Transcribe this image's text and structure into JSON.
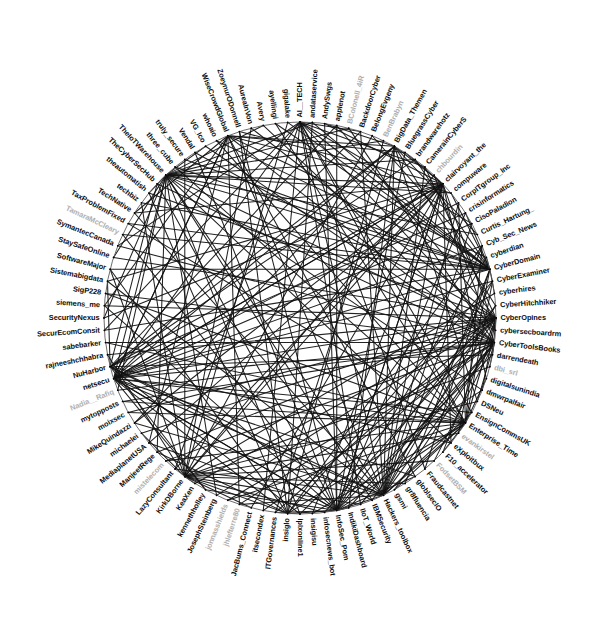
{
  "figure": {
    "title": "",
    "type": "circular-network-graph",
    "background_color": "#ffffff",
    "label_color": "#0d0d0d",
    "dim_label_color": "#aeaeae",
    "edge_color": "#111111",
    "ring_color": "#5a5a5a"
  },
  "chart_data": {
    "type": "scatter",
    "layout": "circular",
    "title": "",
    "subtitle": "",
    "xlabel": "",
    "ylabel": "",
    "grid": false,
    "legend": null,
    "center_x": 300,
    "center_y": 318,
    "radius": 196,
    "node_count": 100,
    "edge_count": 204,
    "nodes": [
      {
        "id": 0,
        "label": "AI__TECH",
        "dim": false
      },
      {
        "id": 1,
        "label": "andataservice",
        "dim": false
      },
      {
        "id": 2,
        "label": "AndySwgs",
        "dim": false
      },
      {
        "id": 3,
        "label": "applenot",
        "dim": false
      },
      {
        "id": 4,
        "label": "BColonell_4iR",
        "dim": true
      },
      {
        "id": 5,
        "label": "BackdoorCyber",
        "dim": false
      },
      {
        "id": 6,
        "label": "BelongEvgeny",
        "dim": false
      },
      {
        "id": 7,
        "label": "BenBrabyn",
        "dim": true
      },
      {
        "id": 8,
        "label": "BigData_Themen",
        "dim": false
      },
      {
        "id": 9,
        "label": "BluegrassCyber",
        "dim": false
      },
      {
        "id": 10,
        "label": "brandwarehotz",
        "dim": false
      },
      {
        "id": 11,
        "label": "CamerainCyberS",
        "dim": false
      },
      {
        "id": 12,
        "label": "chbourdin",
        "dim": true
      },
      {
        "id": 13,
        "label": "clairvoyant_the",
        "dim": false
      },
      {
        "id": 14,
        "label": "compuware",
        "dim": false
      },
      {
        "id": 15,
        "label": "CorpITgroup_Inc",
        "dim": false
      },
      {
        "id": 16,
        "label": "crisinformatics",
        "dim": false
      },
      {
        "id": 17,
        "label": "CisoPaladion",
        "dim": false
      },
      {
        "id": 18,
        "label": "Curtis_Hartung_",
        "dim": false
      },
      {
        "id": 19,
        "label": "Cyb_Sec_News",
        "dim": false
      },
      {
        "id": 20,
        "label": "cyberdian",
        "dim": false
      },
      {
        "id": 21,
        "label": "CyberDomain",
        "dim": false
      },
      {
        "id": 22,
        "label": "CyberExaminer",
        "dim": false
      },
      {
        "id": 23,
        "label": "cyberhires",
        "dim": false
      },
      {
        "id": 24,
        "label": "CyberHitchhiker",
        "dim": false
      },
      {
        "id": 25,
        "label": "CyberOpines",
        "dim": false
      },
      {
        "id": 26,
        "label": "cybersecboardrm",
        "dim": false
      },
      {
        "id": 27,
        "label": "CyberToolsBooks",
        "dim": false
      },
      {
        "id": 28,
        "label": "darrendeath",
        "dim": false
      },
      {
        "id": 29,
        "label": "dbi_srl",
        "dim": true
      },
      {
        "id": 30,
        "label": "digitalsunindia",
        "dim": false
      },
      {
        "id": 31,
        "label": "dmwrpalfair",
        "dim": false
      },
      {
        "id": 32,
        "label": "DSNeu",
        "dim": false
      },
      {
        "id": 33,
        "label": "EnsignCommsUK",
        "dim": false
      },
      {
        "id": 34,
        "label": "Enterprise_Time",
        "dim": false
      },
      {
        "id": 35,
        "label": "evankirstel",
        "dim": true
      },
      {
        "id": 36,
        "label": "eXploitbux",
        "dim": false
      },
      {
        "id": 37,
        "label": "F10_accelerator",
        "dim": false
      },
      {
        "id": 38,
        "label": "FodsetBSM",
        "dim": true
      },
      {
        "id": 39,
        "label": "Fraudcastnet",
        "dim": false
      },
      {
        "id": 40,
        "label": "globlsecIO",
        "dim": false
      },
      {
        "id": 41,
        "label": "gr8fluencia",
        "dim": false
      },
      {
        "id": 42,
        "label": "gsmi",
        "dim": false
      },
      {
        "id": 43,
        "label": "Hackers_toolbox",
        "dim": false
      },
      {
        "id": 44,
        "label": "IBMSecurity",
        "dim": false
      },
      {
        "id": 45,
        "label": "IIoT_World",
        "dim": false
      },
      {
        "id": 46,
        "label": "IndikiDashboard",
        "dim": false
      },
      {
        "id": 47,
        "label": "InfoSec_Pom",
        "dim": false
      },
      {
        "id": 48,
        "label": "infosecnews_bot",
        "dim": false
      },
      {
        "id": 49,
        "label": "insigisu",
        "dim": false
      },
      {
        "id": 50,
        "label": "iplxonline1",
        "dim": false
      },
      {
        "id": 51,
        "label": "insiglo",
        "dim": false
      },
      {
        "id": 52,
        "label": "ITGovernances",
        "dim": false
      },
      {
        "id": 53,
        "label": "itsecondex",
        "dim": false
      },
      {
        "id": 54,
        "label": "JacBums_Connect",
        "dim": false
      },
      {
        "id": 55,
        "label": "jhlefterre80",
        "dim": true
      },
      {
        "id": 56,
        "label": "jonnasshields",
        "dim": true
      },
      {
        "id": 57,
        "label": "JosephSteinberg",
        "dim": false
      },
      {
        "id": 58,
        "label": "kennethholley",
        "dim": false
      },
      {
        "id": 59,
        "label": "KeaXen",
        "dim": false
      },
      {
        "id": 60,
        "label": "KirkDBorne",
        "dim": false
      },
      {
        "id": 61,
        "label": "LazyConsultant",
        "dim": false
      },
      {
        "id": 62,
        "label": "mistelecom",
        "dim": true
      },
      {
        "id": 63,
        "label": "ManjeetRege",
        "dim": false
      },
      {
        "id": 64,
        "label": "MediaplanetUSA",
        "dim": false
      },
      {
        "id": 65,
        "label": "michaelei",
        "dim": false
      },
      {
        "id": 66,
        "label": "MikeQuindazzi",
        "dim": false
      },
      {
        "id": 67,
        "label": "moixsec",
        "dim": false
      },
      {
        "id": 68,
        "label": "mytopposts",
        "dim": false
      },
      {
        "id": 69,
        "label": "Nadia__Rafiq",
        "dim": true
      },
      {
        "id": 70,
        "label": "netsecu",
        "dim": false
      },
      {
        "id": 71,
        "label": "NuHarbor",
        "dim": false
      },
      {
        "id": 72,
        "label": "rajneeshchhabra",
        "dim": false
      },
      {
        "id": 73,
        "label": "sabebarker",
        "dim": false
      },
      {
        "id": 74,
        "label": "SecurEcomConsit",
        "dim": false
      },
      {
        "id": 75,
        "label": "SecurityNexus",
        "dim": false
      },
      {
        "id": 76,
        "label": "siemens_me",
        "dim": false
      },
      {
        "id": 77,
        "label": "SigP228",
        "dim": false
      },
      {
        "id": 78,
        "label": "Sistemabigdata",
        "dim": false
      },
      {
        "id": 79,
        "label": "SoftwareMajor",
        "dim": false
      },
      {
        "id": 80,
        "label": "StaySafeOnline",
        "dim": false
      },
      {
        "id": 81,
        "label": "SymantecCanada",
        "dim": false
      },
      {
        "id": 82,
        "label": "TamaraMcCleary",
        "dim": true
      },
      {
        "id": 83,
        "label": "TaxProblemFixed",
        "dim": false
      },
      {
        "id": 84,
        "label": "TechNative",
        "dim": false
      },
      {
        "id": 85,
        "label": "techbiz",
        "dim": false
      },
      {
        "id": 86,
        "label": "theautomatish",
        "dim": false
      },
      {
        "id": 87,
        "label": "TheCyberSecHub",
        "dim": false
      },
      {
        "id": 88,
        "label": "TheIoTWarehouse",
        "dim": false
      },
      {
        "id": 89,
        "label": "three_cube",
        "dim": false
      },
      {
        "id": 90,
        "label": "truly_secure",
        "dim": false
      },
      {
        "id": 91,
        "label": "Vendal",
        "dim": false
      },
      {
        "id": 92,
        "label": "VG_Ico",
        "dim": false
      },
      {
        "id": 93,
        "label": "whoaio",
        "dim": false
      },
      {
        "id": 94,
        "label": "WiseCrowdGlobal",
        "dim": false
      },
      {
        "id": 95,
        "label": "ZoeynurODonnell",
        "dim": false
      },
      {
        "id": 96,
        "label": "AureaInVon",
        "dim": false
      },
      {
        "id": 97,
        "label": "Avery",
        "dim": false
      },
      {
        "id": 98,
        "label": "ayellingi",
        "dim": false
      },
      {
        "id": 99,
        "label": "gigalake",
        "dim": false
      }
    ],
    "edges": [
      [
        70,
        13
      ],
      [
        70,
        21
      ],
      [
        70,
        25
      ],
      [
        70,
        27
      ],
      [
        70,
        22
      ],
      [
        70,
        19
      ],
      [
        70,
        15
      ],
      [
        70,
        34
      ],
      [
        70,
        43
      ],
      [
        70,
        47
      ],
      [
        70,
        33
      ],
      [
        70,
        8
      ],
      [
        70,
        0
      ],
      [
        70,
        88
      ],
      [
        70,
        94
      ],
      [
        70,
        58
      ],
      [
        70,
        51
      ],
      [
        70,
        40
      ],
      [
        70,
        5
      ],
      [
        70,
        17
      ],
      [
        13,
        70
      ],
      [
        13,
        71
      ],
      [
        13,
        75
      ],
      [
        13,
        78
      ],
      [
        13,
        84
      ],
      [
        13,
        88
      ],
      [
        13,
        43
      ],
      [
        13,
        47
      ],
      [
        13,
        54
      ],
      [
        13,
        60
      ],
      [
        13,
        26
      ],
      [
        13,
        36
      ],
      [
        13,
        30
      ],
      [
        13,
        9
      ],
      [
        13,
        2
      ],
      [
        13,
        95
      ],
      [
        13,
        66
      ],
      [
        13,
        64
      ],
      [
        13,
        61
      ],
      [
        13,
        49
      ],
      [
        25,
        72
      ],
      [
        25,
        76
      ],
      [
        25,
        80
      ],
      [
        25,
        86
      ],
      [
        25,
        91
      ],
      [
        25,
        44
      ],
      [
        25,
        48
      ],
      [
        25,
        52
      ],
      [
        25,
        57
      ],
      [
        25,
        63
      ],
      [
        25,
        28
      ],
      [
        25,
        37
      ],
      [
        25,
        31
      ],
      [
        25,
        11
      ],
      [
        25,
        3
      ],
      [
        25,
        96
      ],
      [
        25,
        67
      ],
      [
        25,
        65
      ],
      [
        25,
        59
      ],
      [
        25,
        50
      ],
      [
        27,
        73
      ],
      [
        27,
        77
      ],
      [
        27,
        81
      ],
      [
        27,
        87
      ],
      [
        27,
        92
      ],
      [
        27,
        45
      ],
      [
        27,
        46
      ],
      [
        27,
        53
      ],
      [
        27,
        56
      ],
      [
        27,
        62
      ],
      [
        27,
        29
      ],
      [
        27,
        38
      ],
      [
        27,
        32
      ],
      [
        27,
        12
      ],
      [
        27,
        4
      ],
      [
        27,
        97
      ],
      [
        27,
        68
      ],
      [
        27,
        69
      ],
      [
        27,
        55
      ],
      [
        27,
        42
      ],
      [
        21,
        74
      ],
      [
        21,
        79
      ],
      [
        21,
        83
      ],
      [
        21,
        85
      ],
      [
        21,
        93
      ],
      [
        21,
        41
      ],
      [
        21,
        39
      ],
      [
        21,
        35
      ],
      [
        21,
        23
      ],
      [
        21,
        20
      ],
      [
        21,
        16
      ],
      [
        21,
        14
      ],
      [
        21,
        10
      ],
      [
        21,
        6
      ],
      [
        21,
        1
      ],
      [
        21,
        98
      ],
      [
        21,
        99
      ],
      [
        21,
        90
      ],
      [
        21,
        89
      ],
      [
        21,
        82
      ],
      [
        43,
        0
      ],
      [
        43,
        8
      ],
      [
        43,
        15
      ],
      [
        43,
        19
      ],
      [
        43,
        22
      ],
      [
        43,
        27
      ],
      [
        43,
        33
      ],
      [
        43,
        47
      ],
      [
        43,
        55
      ],
      [
        43,
        61
      ],
      [
        43,
        66
      ],
      [
        43,
        71
      ],
      [
        43,
        78
      ],
      [
        43,
        84
      ],
      [
        43,
        88
      ],
      [
        43,
        94
      ],
      [
        43,
        5
      ],
      [
        43,
        11
      ],
      [
        43,
        17
      ],
      [
        43,
        24
      ],
      [
        47,
        2
      ],
      [
        47,
        9
      ],
      [
        47,
        16
      ],
      [
        47,
        20
      ],
      [
        47,
        24
      ],
      [
        47,
        28
      ],
      [
        47,
        34
      ],
      [
        47,
        40
      ],
      [
        47,
        46
      ],
      [
        47,
        52
      ],
      [
        47,
        58
      ],
      [
        47,
        64
      ],
      [
        47,
        70
      ],
      [
        47,
        76
      ],
      [
        47,
        82
      ],
      [
        47,
        87
      ],
      [
        47,
        91
      ],
      [
        47,
        95
      ],
      [
        47,
        3
      ],
      [
        47,
        13
      ],
      [
        88,
        4
      ],
      [
        88,
        10
      ],
      [
        88,
        18
      ],
      [
        88,
        26
      ],
      [
        88,
        31
      ],
      [
        88,
        36
      ],
      [
        88,
        44
      ],
      [
        88,
        50
      ],
      [
        88,
        57
      ],
      [
        88,
        63
      ],
      [
        88,
        69
      ],
      [
        88,
        75
      ],
      [
        88,
        80
      ],
      [
        88,
        86
      ],
      [
        88,
        92
      ],
      [
        88,
        97
      ],
      [
        88,
        1
      ],
      [
        88,
        7
      ],
      [
        88,
        14
      ],
      [
        88,
        21
      ],
      [
        60,
        12
      ],
      [
        60,
        23
      ],
      [
        60,
        29
      ],
      [
        60,
        35
      ],
      [
        60,
        41
      ],
      [
        60,
        48
      ],
      [
        60,
        54
      ],
      [
        60,
        59
      ],
      [
        60,
        65
      ],
      [
        60,
        72
      ],
      [
        60,
        79
      ],
      [
        60,
        85
      ],
      [
        60,
        90
      ],
      [
        60,
        96
      ],
      [
        60,
        6
      ],
      [
        60,
        32
      ],
      [
        60,
        38
      ],
      [
        60,
        45
      ],
      [
        60,
        51
      ],
      [
        60,
        99
      ],
      [
        34,
        19
      ],
      [
        34,
        25
      ],
      [
        34,
        30
      ],
      [
        34,
        37
      ],
      [
        34,
        42
      ],
      [
        34,
        49
      ],
      [
        34,
        56
      ],
      [
        34,
        62
      ],
      [
        34,
        68
      ],
      [
        34,
        73
      ],
      [
        34,
        77
      ],
      [
        34,
        83
      ],
      [
        34,
        89
      ],
      [
        34,
        93
      ],
      [
        34,
        98
      ],
      [
        34,
        0
      ],
      [
        34,
        15
      ],
      [
        34,
        22
      ],
      [
        34,
        43
      ],
      [
        34,
        67
      ],
      [
        0,
        5
      ],
      [
        0,
        11
      ],
      [
        0,
        17
      ],
      [
        0,
        21
      ],
      [
        0,
        26
      ],
      [
        0,
        33
      ],
      [
        0,
        39
      ],
      [
        0,
        45
      ],
      [
        0,
        53
      ],
      [
        0,
        61
      ],
      [
        0,
        74
      ],
      [
        0,
        81
      ],
      [
        8,
        13
      ],
      [
        8,
        18
      ],
      [
        8,
        24
      ],
      [
        8,
        32
      ],
      [
        8,
        46
      ],
      [
        8,
        52
      ],
      [
        8,
        66
      ],
      [
        8,
        71
      ],
      [
        8,
        94
      ],
      [
        8,
        2
      ],
      [
        94,
        14
      ],
      [
        94,
        20
      ],
      [
        94,
        27
      ],
      [
        94,
        40
      ],
      [
        94,
        55
      ],
      [
        94,
        64
      ],
      [
        94,
        70
      ],
      [
        94,
        76
      ],
      [
        94,
        84
      ],
      [
        94,
        9
      ],
      [
        71,
        16
      ],
      [
        71,
        28
      ],
      [
        71,
        36
      ],
      [
        71,
        44
      ],
      [
        71,
        50
      ],
      [
        71,
        58
      ],
      [
        71,
        78
      ],
      [
        71,
        87
      ],
      [
        71,
        3
      ],
      [
        71,
        10
      ],
      [
        51,
        7
      ],
      [
        51,
        22
      ],
      [
        51,
        31
      ],
      [
        51,
        47
      ],
      [
        51,
        63
      ],
      [
        51,
        79
      ],
      [
        51,
        86
      ],
      [
        51,
        95
      ],
      [
        51,
        1
      ],
      [
        51,
        19
      ]
    ]
  }
}
